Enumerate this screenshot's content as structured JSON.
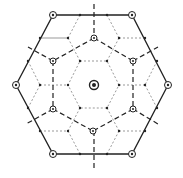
{
  "diagram": {
    "title": "",
    "type": "hexagonal symmetry diagram",
    "colors": {
      "stroke": "#222222",
      "thin": "#555555",
      "background": "#ffffff"
    },
    "center": {
      "x": 94,
      "y": 85,
      "symbol": "sixfold-axis"
    },
    "outer_hexagon": [
      [
        53,
        15
      ],
      [
        132,
        15
      ],
      [
        168,
        85
      ],
      [
        132,
        154
      ],
      [
        53,
        154
      ],
      [
        16,
        85
      ]
    ],
    "outer_vertex_symbol": "twofold-axis-circle",
    "inner_threefold": [
      [
        94,
        38
      ],
      [
        133,
        61
      ],
      [
        133,
        109
      ],
      [
        93,
        131
      ],
      [
        53,
        109
      ],
      [
        53,
        61
      ]
    ],
    "inner_hexagon": [
      [
        80,
        61
      ],
      [
        107,
        61
      ],
      [
        119,
        85
      ],
      [
        107,
        108
      ],
      [
        80,
        108
      ],
      [
        68,
        85
      ]
    ]
  }
}
